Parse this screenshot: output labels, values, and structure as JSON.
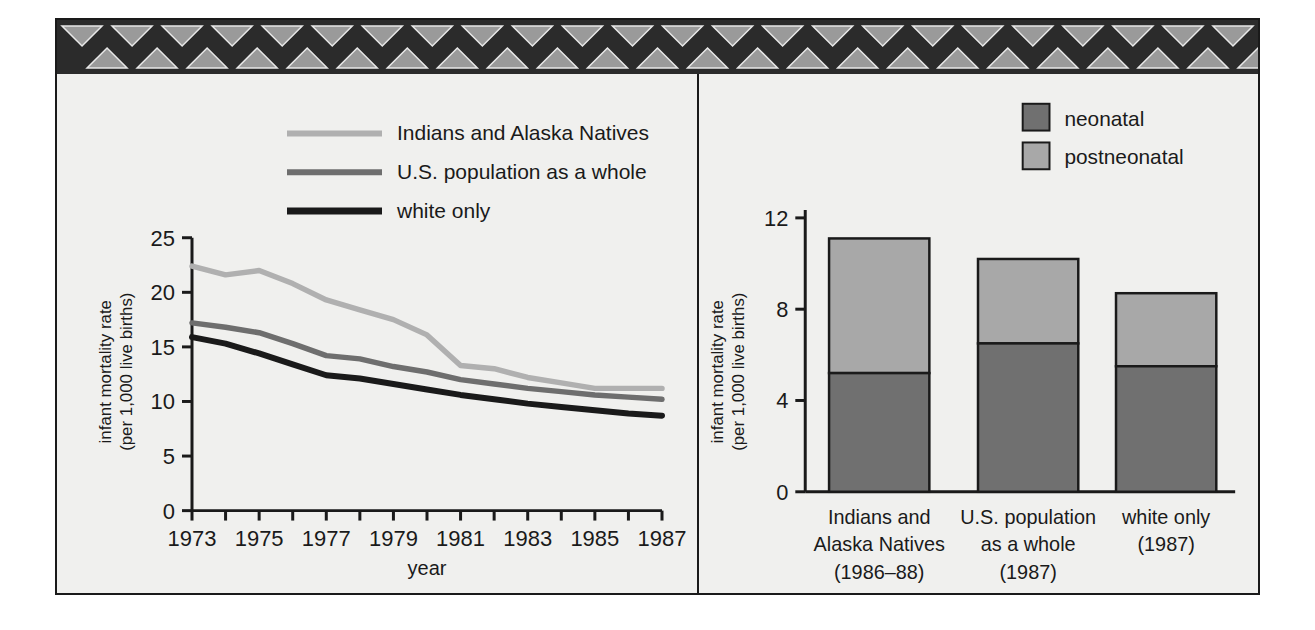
{
  "figure": {
    "border_color": "#1a1a1a",
    "background": "#f0f0ee",
    "band": {
      "name": "triangle-border-band",
      "dark": "#2b2b2b",
      "light": "#9a9a9a",
      "repeats": 24
    }
  },
  "colors": {
    "indians": "#b0b0b0",
    "us_population": "#6e6e6e",
    "white_only": "#1a1a1a",
    "neonatal": "#707070",
    "postneonatal": "#a8a8a8",
    "axis": "#1a1a1a"
  },
  "left_chart": {
    "legend": [
      {
        "label": "Indians and Alaska Natives",
        "color": "#b0b0b0"
      },
      {
        "label": "U.S. population as a whole",
        "color": "#6e6e6e"
      },
      {
        "label": "white only",
        "color": "#1a1a1a"
      }
    ],
    "ylabel_line1": "infant mortality rate",
    "ylabel_line2": "(per 1,000 live births)",
    "xlabel": "year",
    "yticks": [
      "0",
      "5",
      "10",
      "15",
      "20",
      "25"
    ],
    "xticks": [
      "1973",
      "1975",
      "1977",
      "1979",
      "1981",
      "1983",
      "1985",
      "1987"
    ]
  },
  "right_chart": {
    "legend": [
      {
        "label": "neonatal",
        "color": "#707070"
      },
      {
        "label": "postneonatal",
        "color": "#a8a8a8"
      }
    ],
    "ylabel_line1": "infant mortality rate",
    "ylabel_line2": "(per 1,000 live births)",
    "yticks": [
      "0",
      "4",
      "8",
      "12"
    ],
    "categories": [
      {
        "line1": "Indians and",
        "line2": "Alaska Natives",
        "line3": "(1986–88)"
      },
      {
        "line1": "U.S. population",
        "line2": "as a whole",
        "line3": "(1987)"
      },
      {
        "line1": "white only",
        "line2": "(1987)",
        "line3": ""
      }
    ]
  },
  "chart_data": [
    {
      "type": "line",
      "title": "",
      "xlabel": "year",
      "ylabel": "infant mortality rate (per 1,000 live births)",
      "xlim": [
        1973,
        1987
      ],
      "ylim": [
        0,
        25
      ],
      "yticks": [
        0,
        5,
        10,
        15,
        20,
        25
      ],
      "x": [
        1973,
        1974,
        1975,
        1976,
        1977,
        1978,
        1979,
        1980,
        1981,
        1982,
        1983,
        1984,
        1985,
        1986,
        1987
      ],
      "grid": false,
      "legend_position": "top-center",
      "series": [
        {
          "name": "Indians and Alaska Natives",
          "color": "#b0b0b0",
          "values": [
            22.4,
            21.6,
            22.0,
            20.8,
            19.3,
            18.4,
            17.5,
            16.1,
            13.3,
            13.0,
            12.2,
            11.7,
            11.2,
            11.2,
            11.2
          ]
        },
        {
          "name": "U.S. population as a whole",
          "color": "#6e6e6e",
          "values": [
            17.2,
            16.8,
            16.3,
            15.3,
            14.2,
            13.9,
            13.2,
            12.7,
            12.0,
            11.6,
            11.2,
            10.9,
            10.6,
            10.4,
            10.2
          ]
        },
        {
          "name": "white only",
          "color": "#1a1a1a",
          "values": [
            15.9,
            15.3,
            14.4,
            13.4,
            12.4,
            12.1,
            11.6,
            11.1,
            10.6,
            10.2,
            9.8,
            9.5,
            9.2,
            8.9,
            8.7
          ]
        }
      ]
    },
    {
      "type": "bar",
      "stacked": true,
      "title": "",
      "xlabel": "",
      "ylabel": "infant mortality rate (per 1,000 live births)",
      "ylim": [
        0,
        12
      ],
      "yticks": [
        0,
        4,
        8,
        12
      ],
      "grid": false,
      "legend_position": "top-right",
      "categories": [
        "Indians and Alaska Natives (1986–88)",
        "U.S. population as a whole (1987)",
        "white only (1987)"
      ],
      "series": [
        {
          "name": "neonatal",
          "color": "#707070",
          "values": [
            5.2,
            6.5,
            5.5
          ]
        },
        {
          "name": "postneonatal",
          "color": "#a8a8a8",
          "values": [
            5.9,
            3.7,
            3.2
          ]
        }
      ],
      "totals": [
        11.1,
        10.2,
        8.7
      ]
    }
  ]
}
